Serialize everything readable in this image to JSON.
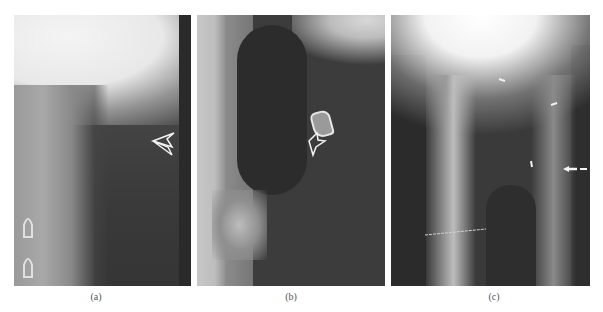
{
  "figure": {
    "panels": [
      {
        "id": "a",
        "label": "(a)",
        "description": "Lateral soft-tissue neck radiograph with open arrow pointing to soft tissue mass",
        "annotations": [
          {
            "type": "open-arrow",
            "direction": "left"
          }
        ]
      },
      {
        "id": "b",
        "label": "(b)",
        "description": "Lateral radiograph with open arrow pointing to calcified structure",
        "annotations": [
          {
            "type": "open-arrow",
            "direction": "up-left"
          }
        ]
      },
      {
        "id": "c",
        "label": "(c)",
        "description": "Frontal tomogram with small white arrows marking airway walls",
        "annotations": [
          {
            "type": "small-arrow"
          },
          {
            "type": "small-arrow"
          },
          {
            "type": "small-arrow"
          },
          {
            "type": "dashed-arrow",
            "direction": "left"
          }
        ]
      }
    ],
    "colors": {
      "background": "#ffffff",
      "label_text": "#555555",
      "annotation": "#ffffff"
    }
  }
}
